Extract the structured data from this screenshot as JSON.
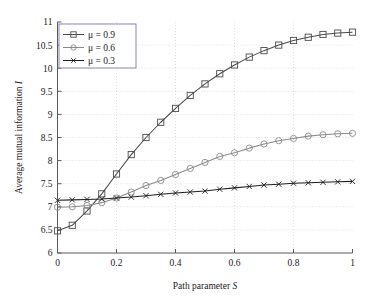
{
  "figure": {
    "width": 372,
    "height": 304,
    "background": "#ffffff"
  },
  "chart_data": {
    "type": "line",
    "title": "",
    "xlabel": "Path parameter S",
    "ylabel": "Average mutual information I",
    "xlim": [
      0,
      1
    ],
    "ylim": [
      6,
      11
    ],
    "xticks": [
      0,
      0.2,
      0.4,
      0.6,
      0.8,
      1
    ],
    "xtick_labels": [
      "0",
      "0.2",
      "0.4",
      "0.6",
      "0.8",
      "1"
    ],
    "yticks": [
      6,
      6.5,
      7,
      7.5,
      8,
      8.5,
      9,
      9.5,
      10,
      10.5,
      11
    ],
    "ytick_labels": [
      "6",
      "6.5",
      "7",
      "7.5",
      "8",
      "8.5",
      "9",
      "9.5",
      "10",
      "10.5",
      "11"
    ],
    "grid": true,
    "legend_position": "upper left",
    "x": [
      0,
      0.05,
      0.1,
      0.15,
      0.2,
      0.25,
      0.3,
      0.35,
      0.4,
      0.45,
      0.5,
      0.55,
      0.6,
      0.65,
      0.7,
      0.75,
      0.8,
      0.85,
      0.9,
      0.95,
      1
    ],
    "series": [
      {
        "name": "μ = 0.9",
        "legend_label": "μ = 0.9",
        "marker": "square",
        "color": "#4a4a4a",
        "values": [
          6.48,
          6.6,
          6.91,
          7.28,
          7.71,
          8.13,
          8.5,
          8.83,
          9.13,
          9.41,
          9.66,
          9.88,
          10.07,
          10.24,
          10.38,
          10.5,
          10.6,
          10.67,
          10.73,
          10.76,
          10.78
        ]
      },
      {
        "name": "μ = 0.6",
        "legend_label": "μ = 0.6",
        "marker": "circle",
        "color": "#8a8a8a",
        "values": [
          6.99,
          7.0,
          7.03,
          7.09,
          7.19,
          7.32,
          7.46,
          7.57,
          7.7,
          7.83,
          7.96,
          8.09,
          8.17,
          8.27,
          8.36,
          8.43,
          8.48,
          8.53,
          8.56,
          8.58,
          8.59
        ]
      },
      {
        "name": "μ = 0.3",
        "legend_label": "μ = 0.3",
        "marker": "x",
        "color": "#1f1f1f",
        "values": [
          7.14,
          7.15,
          7.16,
          7.17,
          7.19,
          7.21,
          7.24,
          7.27,
          7.3,
          7.32,
          7.34,
          7.38,
          7.41,
          7.44,
          7.47,
          7.49,
          7.51,
          7.52,
          7.53,
          7.54,
          7.55
        ]
      }
    ]
  }
}
